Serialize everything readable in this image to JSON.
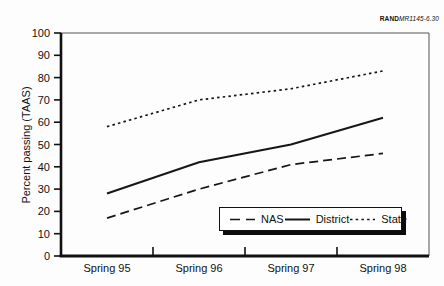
{
  "annotation": {
    "publisher": "RAND",
    "doc_id": "MR1145-6.30"
  },
  "chart_data": {
    "type": "line",
    "title": "",
    "categories": [
      "Spring 95",
      "Spring 96",
      "Spring 97",
      "Spring 98"
    ],
    "series": [
      {
        "name": "NAS",
        "style": "long-dash",
        "values": [
          17,
          30,
          41,
          46
        ]
      },
      {
        "name": "District",
        "style": "solid",
        "values": [
          28,
          42,
          50,
          62
        ]
      },
      {
        "name": "State",
        "style": "dotted",
        "values": [
          58,
          70,
          75,
          83
        ]
      }
    ],
    "xlabel": "",
    "ylabel": "Percent passing (TAAS)",
    "ylim": [
      0,
      100
    ],
    "ytick_step": 10,
    "grid": false,
    "legend_position": "inside-bottom-right",
    "line_color": "#161616",
    "axis_color": "#111111",
    "box_color": "#555555"
  }
}
